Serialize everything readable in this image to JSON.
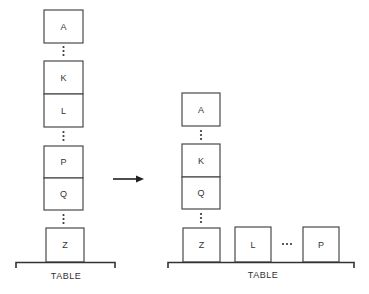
{
  "diagram": {
    "before": {
      "stack": [
        "A",
        "...",
        "K",
        "L",
        "...",
        "P",
        "Q",
        "...",
        "Z"
      ],
      "surface_label": "TABLE"
    },
    "after": {
      "stack": [
        "A",
        "...",
        "K",
        "Q",
        "...",
        "Z"
      ],
      "table_blocks": [
        "L",
        "...",
        "P"
      ],
      "surface_label": "TABLE"
    },
    "arrow": {
      "direction": "right",
      "meaning": "transforms-to"
    }
  }
}
